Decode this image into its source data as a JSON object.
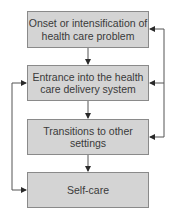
{
  "diagram": {
    "type": "flowchart",
    "nodes": [
      {
        "id": "n1",
        "label": "Onset or intensification of health care problem"
      },
      {
        "id": "n2",
        "label": "Entrance into the health care delivery system"
      },
      {
        "id": "n3",
        "label": "Transitions to other settings"
      },
      {
        "id": "n4",
        "label": "Self-care"
      }
    ],
    "edges": [
      {
        "from": "n1",
        "to": "n2"
      },
      {
        "from": "n2",
        "to": "n3"
      },
      {
        "from": "n3",
        "to": "n4"
      },
      {
        "from": "right-feedback",
        "to": "n1"
      },
      {
        "from": "right-feedback",
        "to": "n2"
      },
      {
        "from": "right-feedback",
        "to": "n3"
      },
      {
        "from": "left-feedback",
        "to": "n2"
      },
      {
        "from": "left-feedback",
        "to": "n4"
      }
    ],
    "colors": {
      "box_fill": "#d4d4d4",
      "box_border": "#8a8a8a",
      "line": "#3a3a3a"
    }
  }
}
